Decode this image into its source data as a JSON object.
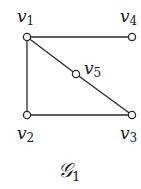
{
  "graph": {
    "caption": {
      "main": "𝒢",
      "sub": "1",
      "x": 58,
      "y": 160
    },
    "colors": {
      "edge": "#2a2a2a",
      "node_stroke": "#2a2a2a",
      "node_fill": "#ffffff",
      "text": "#1a1a1a"
    },
    "nodes": [
      {
        "id": "v1",
        "main": "v",
        "sub": "1",
        "x": 27,
        "y": 37,
        "label_x": 17,
        "label_y": 8
      },
      {
        "id": "v2",
        "main": "v",
        "sub": "2",
        "x": 27,
        "y": 115,
        "label_x": 17,
        "label_y": 125
      },
      {
        "id": "v3",
        "main": "v",
        "sub": "3",
        "x": 132,
        "y": 115,
        "label_x": 120,
        "label_y": 125
      },
      {
        "id": "v4",
        "main": "v",
        "sub": "4",
        "x": 132,
        "y": 37,
        "label_x": 120,
        "label_y": 8
      },
      {
        "id": "v5",
        "main": "v",
        "sub": "5",
        "x": 76,
        "y": 74,
        "label_x": 84,
        "label_y": 60
      }
    ],
    "edges": [
      {
        "from": "v1",
        "to": "v4"
      },
      {
        "from": "v1",
        "to": "v2"
      },
      {
        "from": "v2",
        "to": "v3"
      },
      {
        "from": "v1",
        "to": "v5"
      },
      {
        "from": "v5",
        "to": "v3"
      }
    ]
  }
}
